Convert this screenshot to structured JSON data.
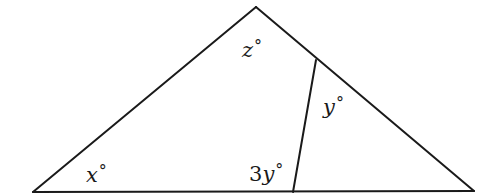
{
  "diagram": {
    "type": "triangle-with-cevian",
    "vertices": {
      "apex": {
        "x": 256,
        "y": 7
      },
      "left": {
        "x": 33,
        "y": 192
      },
      "right": {
        "x": 474,
        "y": 191
      }
    },
    "cevian": {
      "from": {
        "x": 316,
        "y": 60
      },
      "to": {
        "x": 293,
        "y": 192
      }
    },
    "line_color": "#1a1a1a",
    "labels": {
      "z": {
        "coef": "",
        "var": "z",
        "deg": "°"
      },
      "y": {
        "coef": "",
        "var": "y",
        "deg": "°"
      },
      "x": {
        "coef": "",
        "var": "x",
        "deg": "°"
      },
      "three_y": {
        "coef": "3",
        "var": "y",
        "deg": "°"
      }
    }
  }
}
